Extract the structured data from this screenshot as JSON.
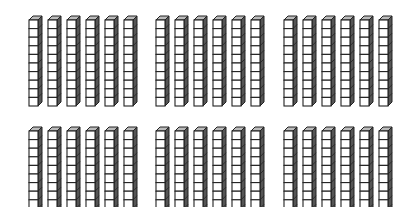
{
  "diagram": {
    "type": "base-ten-blocks",
    "colors": {
      "background": "#ffffff",
      "face": "#ffffff",
      "edge": "#222222",
      "side": "#555555",
      "top": "#bbbbbb"
    },
    "rods_per_group": 6,
    "cubes_per_rod": 10,
    "cube": {
      "w": 9,
      "h": 8.6,
      "depth": 4
    },
    "rod_spacing": 19,
    "groups": [
      {
        "id": "group-1",
        "row": 0,
        "col": 0,
        "x": 29,
        "y": 20
      },
      {
        "id": "group-2",
        "row": 0,
        "col": 1,
        "x": 156,
        "y": 20
      },
      {
        "id": "group-3",
        "row": 0,
        "col": 2,
        "x": 284,
        "y": 20
      },
      {
        "id": "group-4",
        "row": 1,
        "col": 0,
        "x": 29,
        "y": 131
      },
      {
        "id": "group-5",
        "row": 1,
        "col": 1,
        "x": 156,
        "y": 131
      },
      {
        "id": "group-6",
        "row": 1,
        "col": 2,
        "x": 284,
        "y": 131
      }
    ],
    "total_rods": 36,
    "value_represented": 360
  }
}
